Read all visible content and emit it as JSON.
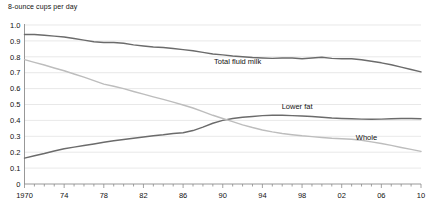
{
  "chart_data": {
    "type": "line",
    "title": "8-ounce cups per day",
    "subtitle": "",
    "xlabel": "",
    "ylabel": "8-ounce cups per day",
    "xlim": [
      1970,
      2010
    ],
    "ylim": [
      0,
      1.0
    ],
    "grid": true,
    "legend_position": "inline-annotations",
    "x": [
      1970,
      1971,
      1972,
      1973,
      1974,
      1975,
      1976,
      1977,
      1978,
      1979,
      1980,
      1981,
      1982,
      1983,
      1984,
      1985,
      1986,
      1987,
      1988,
      1989,
      1990,
      1991,
      1992,
      1993,
      1994,
      1995,
      1996,
      1997,
      1998,
      1999,
      2000,
      2001,
      2002,
      2003,
      2004,
      2005,
      2006,
      2007,
      2008,
      2009,
      2010
    ],
    "x_tick_labels": [
      "1970",
      "74",
      "78",
      "82",
      "86",
      "90",
      "94",
      "98",
      "02",
      "06",
      "10"
    ],
    "x_tick_values": [
      1970,
      1974,
      1978,
      1982,
      1986,
      1990,
      1994,
      1998,
      2002,
      2006,
      2010
    ],
    "y_tick_labels": [
      "0",
      "0.1",
      "0.2",
      "0.3",
      "0.4",
      "0.5",
      "0.6",
      "0.7",
      "0.8",
      "0.9",
      "1.0"
    ],
    "y_tick_values": [
      0,
      0.1,
      0.2,
      0.3,
      0.4,
      0.5,
      0.6,
      0.7,
      0.8,
      0.9,
      1.0
    ],
    "series": [
      {
        "name": "Total fluid milk",
        "color": "#6b6b6b",
        "label_x": 1991.5,
        "label_y": 0.755,
        "values": [
          0.94,
          0.94,
          0.935,
          0.93,
          0.925,
          0.915,
          0.905,
          0.895,
          0.89,
          0.89,
          0.885,
          0.875,
          0.868,
          0.862,
          0.858,
          0.852,
          0.845,
          0.838,
          0.828,
          0.818,
          0.812,
          0.805,
          0.8,
          0.795,
          0.792,
          0.79,
          0.793,
          0.792,
          0.788,
          0.793,
          0.797,
          0.79,
          0.788,
          0.788,
          0.782,
          0.772,
          0.762,
          0.75,
          0.735,
          0.72,
          0.705
        ]
      },
      {
        "name": "Lower fat",
        "color": "#6b6b6b",
        "label_x": 1997.5,
        "label_y": 0.47,
        "values": [
          0.163,
          0.178,
          0.192,
          0.208,
          0.222,
          0.232,
          0.242,
          0.252,
          0.262,
          0.272,
          0.28,
          0.288,
          0.296,
          0.304,
          0.31,
          0.318,
          0.322,
          0.336,
          0.358,
          0.382,
          0.4,
          0.412,
          0.42,
          0.425,
          0.43,
          0.432,
          0.432,
          0.43,
          0.428,
          0.425,
          0.42,
          0.415,
          0.412,
          0.41,
          0.408,
          0.407,
          0.408,
          0.41,
          0.412,
          0.412,
          0.41
        ]
      },
      {
        "name": "Whole",
        "color": "#bdbdbd",
        "label_x": 2004.5,
        "label_y": 0.278,
        "values": [
          0.782,
          0.765,
          0.748,
          0.73,
          0.712,
          0.692,
          0.672,
          0.65,
          0.628,
          0.615,
          0.6,
          0.582,
          0.565,
          0.548,
          0.532,
          0.515,
          0.497,
          0.478,
          0.455,
          0.432,
          0.412,
          0.392,
          0.372,
          0.355,
          0.34,
          0.328,
          0.318,
          0.31,
          0.303,
          0.298,
          0.293,
          0.288,
          0.285,
          0.282,
          0.275,
          0.265,
          0.255,
          0.243,
          0.23,
          0.218,
          0.205
        ]
      }
    ]
  },
  "axes": {
    "y_axis_name": "y-axis",
    "x_axis_name": "x-axis"
  }
}
